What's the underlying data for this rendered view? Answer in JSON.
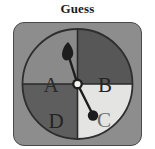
{
  "title": "Guess",
  "wheel": {
    "name": "spinner-wheel",
    "segments": [
      {
        "label": "A",
        "position": "upper-left",
        "fill": "#8a8a8a",
        "text_color": "#2b2b2b"
      },
      {
        "label": "B",
        "position": "upper-right",
        "fill": "#575757",
        "text_color": "#242424"
      },
      {
        "label": "C",
        "position": "lower-right",
        "fill": "#e4e4e2",
        "text_color": "#6e6e6e"
      },
      {
        "label": "D",
        "position": "lower-left",
        "fill": "#5e5e5e",
        "text_color": "#232323"
      }
    ],
    "outline_color": "#2e2e2e",
    "divider_color": "#2a2a2a",
    "card_background": "#8d8d8d",
    "card_border": "#4a4a4a"
  },
  "pointer": {
    "name": "spinner-needle",
    "arrow_points_to": "A",
    "counterweight_points_to": "C",
    "needle_color": "#1d1d1d",
    "hub_color": "#f4f4f2"
  }
}
